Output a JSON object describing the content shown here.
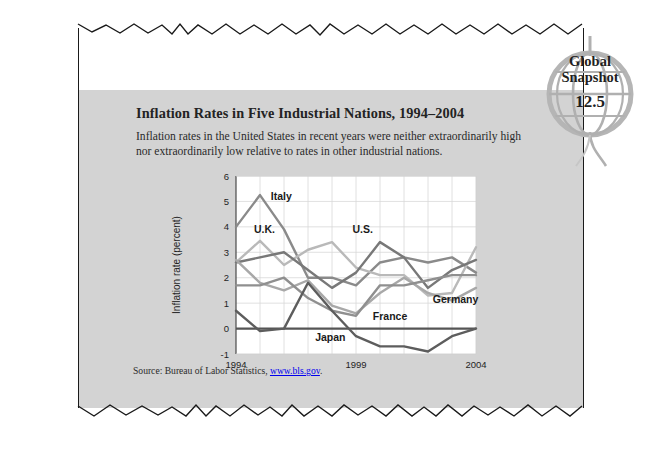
{
  "logo": {
    "line1": "Global",
    "line2": "Snapshot",
    "number": "12.5",
    "icon": "globe-icon"
  },
  "headline": "Inflation Rates in Five Industrial Nations, 1994–2004",
  "blurb": "Inflation rates in the United States in recent years were neither extraordinarily high nor extraordinarily low relative to rates in other industrial nations.",
  "source": {
    "prefix": "Source: Bureau of Labor Statistics, ",
    "link": "www.bls.gov",
    "suffix": "."
  },
  "chart_data": {
    "type": "line",
    "title": "Inflation Rates in Five Industrial Nations, 1994–2004",
    "xlabel": "",
    "ylabel": "Inflation rate (percent)",
    "xlim": [
      1994,
      2004
    ],
    "ylim": [
      -1,
      6
    ],
    "yticks": [
      "6",
      "5",
      "4",
      "3",
      "2",
      "1",
      "0",
      "-1"
    ],
    "ytick_values": [
      6,
      5,
      4,
      3,
      2,
      1,
      0,
      -1
    ],
    "xticks": [
      "1994",
      "1999",
      "2004"
    ],
    "xtick_values": [
      1994,
      1999,
      2004
    ],
    "grid": true,
    "legend": "inline-labels",
    "x": [
      1994,
      1995,
      1996,
      1997,
      1998,
      1999,
      2000,
      2001,
      2002,
      2003,
      2004
    ],
    "series": [
      {
        "name": "Italy",
        "color": "#8a8a8a",
        "label_x": 1995.45,
        "label_y": 5.05,
        "values": [
          4.0,
          5.25,
          3.9,
          2.0,
          2.0,
          1.7,
          2.6,
          2.8,
          2.6,
          2.8,
          2.2
        ]
      },
      {
        "name": "U.K.",
        "color": "#b9b9b9",
        "label_x": 1994.75,
        "label_y": 3.75,
        "values": [
          2.6,
          3.45,
          2.5,
          3.1,
          3.4,
          2.4,
          2.1,
          2.1,
          1.3,
          1.4,
          3.2
        ]
      },
      {
        "name": "U.S.",
        "color": "#787878",
        "label_x": 1998.85,
        "label_y": 3.75,
        "values": [
          2.6,
          2.8,
          3.0,
          2.3,
          1.6,
          2.2,
          3.4,
          2.8,
          1.6,
          2.3,
          2.7
        ]
      },
      {
        "name": "Germany",
        "color": "#a8a8a8",
        "label_x": 2002.2,
        "label_y": 1.0,
        "values": [
          2.7,
          1.8,
          1.5,
          1.9,
          0.9,
          0.6,
          1.4,
          2.0,
          1.4,
          1.1,
          1.6
        ]
      },
      {
        "name": "France",
        "color": "#8f8f8f",
        "label_x": 1999.7,
        "label_y": 0.35,
        "values": [
          1.7,
          1.7,
          2.0,
          1.2,
          0.7,
          0.5,
          1.7,
          1.7,
          1.9,
          2.1,
          2.1
        ]
      },
      {
        "name": "Japan",
        "color": "#5d5d5d",
        "label_x": 1997.3,
        "label_y": -0.5,
        "values": [
          0.7,
          -0.1,
          0.0,
          1.8,
          0.7,
          -0.3,
          -0.7,
          -0.7,
          -0.9,
          -0.3,
          0.0
        ]
      }
    ]
  }
}
